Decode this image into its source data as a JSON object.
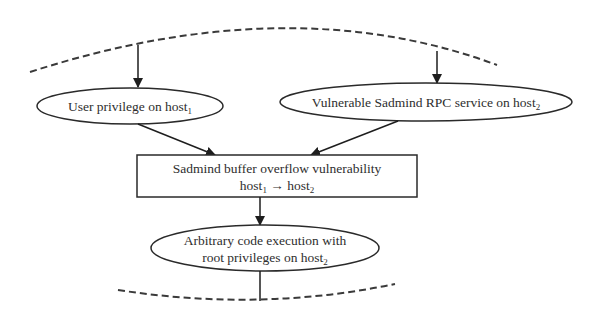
{
  "diagram": {
    "type": "attack-graph-fragment",
    "nodes": {
      "user_privilege": {
        "shape": "ellipse",
        "label": "User privilege on host",
        "subscript": "1"
      },
      "vulnerable_service": {
        "shape": "ellipse",
        "label": "Vulnerable Sadmind RPC service on  host",
        "subscript": "2"
      },
      "exploit": {
        "shape": "rectangle",
        "line1": "Sadmind buffer overflow vulnerability",
        "line2_a": "host",
        "line2_a_sub": "1",
        "arrow": " → ",
        "line2_b": "host",
        "line2_b_sub": "2"
      },
      "code_execution": {
        "shape": "ellipse",
        "line1": "Arbitrary code execution with",
        "line2": "root privileges on host",
        "subscript": "2"
      }
    },
    "edges": [
      {
        "from": "upper-graph",
        "to": "user_privilege"
      },
      {
        "from": "upper-graph",
        "to": "vulnerable_service"
      },
      {
        "from": "user_privilege",
        "to": "exploit"
      },
      {
        "from": "vulnerable_service",
        "to": "exploit"
      },
      {
        "from": "exploit",
        "to": "code_execution"
      },
      {
        "from": "code_execution",
        "to": "lower-graph"
      }
    ],
    "colors": {
      "stroke": "#2a2a2a",
      "dashed": "#3a3a3a",
      "background": "#ffffff"
    }
  }
}
